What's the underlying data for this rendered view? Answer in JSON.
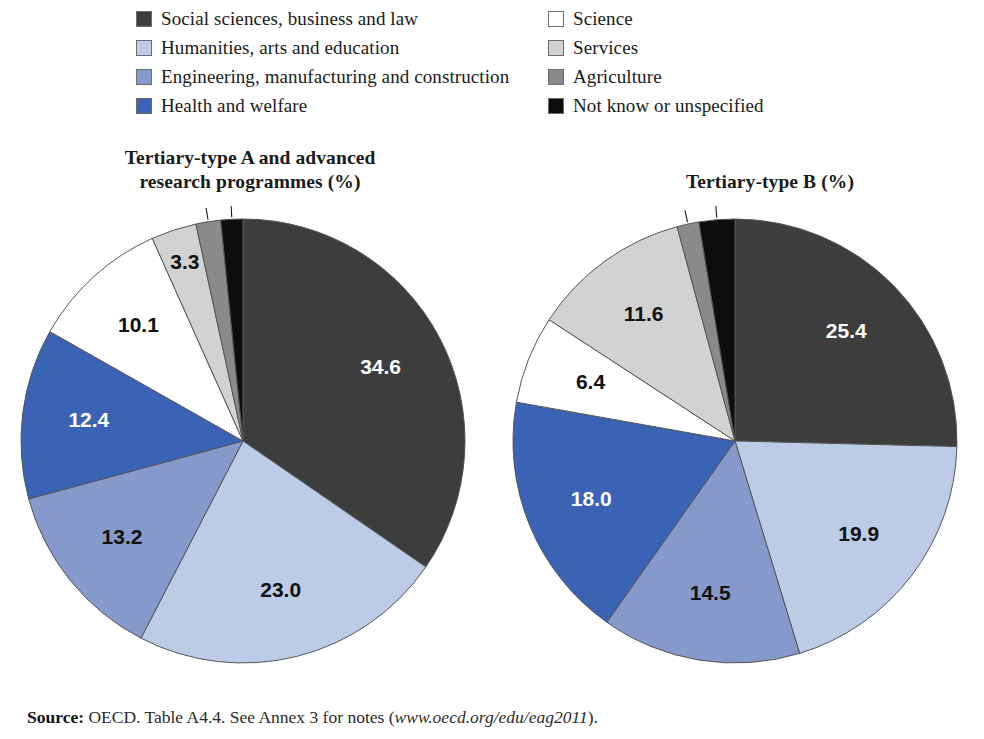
{
  "legend": {
    "left_column": [
      {
        "label": "Social sciences, business and law",
        "color": "#3d3d3d",
        "swatch": "legend-swatch-social-sciences"
      },
      {
        "label": "Humanities, arts and education",
        "color": "#bdcce6",
        "swatch": "legend-swatch-humanities"
      },
      {
        "label": "Engineering, manufacturing and construction",
        "color": "#8699cb",
        "swatch": "legend-swatch-engineering"
      },
      {
        "label": "Health and welfare",
        "color": "#3a62b5",
        "swatch": "legend-swatch-health"
      }
    ],
    "right_column": [
      {
        "label": "Science",
        "color": "#ffffff",
        "swatch": "legend-swatch-science"
      },
      {
        "label": "Services",
        "color": "#d2d2d2",
        "swatch": "legend-swatch-services"
      },
      {
        "label": "Agriculture",
        "color": "#8a8a8a",
        "swatch": "legend-swatch-agriculture"
      },
      {
        "label": "Not know or unspecified",
        "color": "#0d0d0d",
        "swatch": "legend-swatch-not-known"
      }
    ]
  },
  "titles": {
    "left_line1": "Tertiary-type A and advanced",
    "left_line2": "research programmes (%)",
    "right": "Tertiary-type B (%)"
  },
  "source": {
    "bold": "Source:",
    "text": " OECD. Table A4.4. See Annex 3 for notes (",
    "url": "www.oecd.org/edu/eag2011",
    "tail": ")."
  },
  "chart_data": [
    {
      "type": "pie",
      "title": "Tertiary-type A and advanced research programmes (%)",
      "start_angle_deg": 0,
      "direction": "clockwise",
      "categories": [
        "Social sciences, business and law",
        "Humanities, arts and education",
        "Engineering, manufacturing and construction",
        "Health and welfare",
        "Science",
        "Services",
        "Agriculture",
        "Not know or unspecified"
      ],
      "values": [
        34.6,
        23.0,
        13.2,
        12.4,
        10.1,
        3.3,
        1.8,
        1.6
      ],
      "colors": [
        "#3d3d3d",
        "#bdcce6",
        "#8699cb",
        "#3a62b5",
        "#ffffff",
        "#d2d2d2",
        "#8a8a8a",
        "#0d0d0d"
      ],
      "label_colors": [
        "#ffffff",
        "#111111",
        "#111111",
        "#ffffff",
        "#111111",
        "#111111",
        "#111111",
        "#111111"
      ],
      "labels": [
        "34.6",
        "23.0",
        "13.2",
        "12.4",
        "10.1",
        "3.3",
        "1.8",
        "1.6"
      ],
      "label_outside": [
        false,
        false,
        false,
        false,
        false,
        false,
        true,
        true
      ],
      "legend_position": "top"
    },
    {
      "type": "pie",
      "title": "Tertiary-type B (%)",
      "start_angle_deg": 0,
      "direction": "clockwise",
      "categories": [
        "Social sciences, business and law",
        "Humanities, arts and education",
        "Engineering, manufacturing and construction",
        "Health and welfare",
        "Science",
        "Services",
        "Agriculture",
        "Not know or unspecified"
      ],
      "values": [
        25.4,
        19.9,
        14.5,
        18.0,
        6.4,
        11.6,
        1.6,
        2.6
      ],
      "colors": [
        "#3d3d3d",
        "#bdcce6",
        "#8699cb",
        "#3a62b5",
        "#ffffff",
        "#d2d2d2",
        "#8a8a8a",
        "#0d0d0d"
      ],
      "label_colors": [
        "#ffffff",
        "#111111",
        "#111111",
        "#ffffff",
        "#111111",
        "#111111",
        "#111111",
        "#111111"
      ],
      "labels": [
        "25.4",
        "19.9",
        "14.5",
        "18.0",
        "6.4",
        "11.6",
        "1.6",
        "2.6"
      ],
      "label_outside": [
        false,
        false,
        false,
        false,
        false,
        false,
        true,
        true
      ],
      "legend_position": "top"
    }
  ]
}
